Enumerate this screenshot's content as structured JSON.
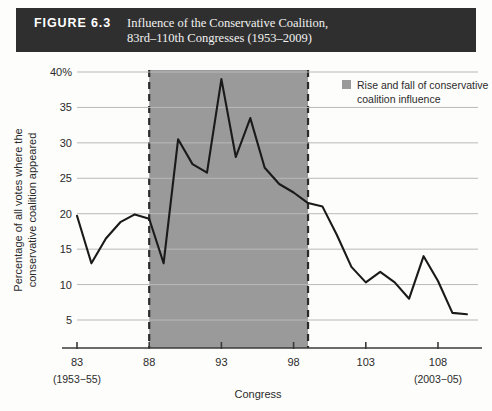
{
  "figure": {
    "label": "FIGURE 6.3",
    "title_line1": "Influence of the Conservative Coalition,",
    "title_line2": "83rd–110th Congresses (1953–2009)"
  },
  "legend": {
    "swatch_color": "#9a9a9a",
    "line1": "Rise and fall of conservative",
    "line2": "coalition influence"
  },
  "axis": {
    "x_title": "Congress",
    "y_title_line1": "Percentage of all votes where the",
    "y_title_line2": "conservative coalition appeared",
    "x_sub_left": "(1953−55)",
    "x_sub_right": "(2003−05)"
  },
  "chart_data": {
    "type": "line",
    "xlabel": "Congress",
    "ylabel": "Percentage of all votes where the conservative coalition appeared",
    "xlim": [
      83,
      110
    ],
    "ylim": [
      0,
      40
    ],
    "yticks": [
      5,
      10,
      15,
      20,
      25,
      30,
      35,
      40
    ],
    "ytick_labels": [
      "5",
      "10",
      "15",
      "20",
      "25",
      "30",
      "35",
      "40%"
    ],
    "xticks": [
      83,
      88,
      93,
      98,
      103,
      108
    ],
    "xtick_labels": [
      "83",
      "88",
      "93",
      "98",
      "103",
      "108"
    ],
    "grid": "horizontal",
    "legend_position": "top-right",
    "shaded_region": {
      "label": "Rise and fall of conservative coalition influence",
      "x_start": 88,
      "x_end": 99,
      "color": "#9a9a9a",
      "border": "dashed"
    },
    "x": [
      83,
      84,
      85,
      86,
      87,
      88,
      89,
      90,
      91,
      92,
      93,
      94,
      95,
      96,
      97,
      98,
      99,
      100,
      101,
      102,
      103,
      104,
      105,
      106,
      107,
      108,
      109,
      110
    ],
    "values": [
      19.7,
      13.0,
      16.5,
      18.8,
      19.9,
      19.3,
      13.0,
      30.5,
      27.0,
      25.8,
      39.0,
      28.0,
      33.5,
      26.5,
      24.2,
      23.0,
      21.5,
      21.0,
      17.0,
      12.5,
      10.3,
      11.8,
      10.3,
      8.0,
      14.0,
      10.5,
      6.0,
      5.8
    ]
  },
  "line_points_extra": {
    "tail_x": [
      108,
      109,
      110
    ],
    "tail_values": [
      7.0,
      6.8,
      3.0
    ]
  }
}
